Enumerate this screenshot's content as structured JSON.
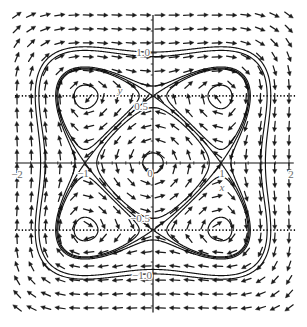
{
  "chart_data": {
    "type": "line",
    "subtype": "phase_portrait_with_direction_field",
    "title": "",
    "xlabel": "x",
    "ylabel": "y",
    "xlim": [
      -2.1,
      2.1
    ],
    "ylim": [
      -1.45,
      1.45
    ],
    "grid": false,
    "legend": null,
    "xticks": [
      -2,
      -1,
      0,
      1,
      2
    ],
    "xtick_labels": [
      "−2",
      "−1",
      "0",
      "1",
      "2"
    ],
    "yticks": [
      -1.0,
      -0.5,
      0.5,
      1.0
    ],
    "ytick_labels": [
      "−1.0",
      "−0.5",
      "0.5",
      "1.0"
    ],
    "x_minor_step": 0.2,
    "y_minor_step": 0.1,
    "axis_extent": {
      "x": [
        -2.03,
        2.07
      ],
      "y": [
        -1.36,
        1.345
      ]
    },
    "system": {
      "H": "(x^2-1)^2 + (y^2/a^2-1)^2",
      "a": 0.61,
      "dx_dt": "dH/dy",
      "dy_dt": "-dH/dx",
      "outer_rotation": "clockwise"
    },
    "direction_field": {
      "columns": 20,
      "rows": 22,
      "x_range": [
        -2.0,
        2.0
      ],
      "y_range": [
        -1.318,
        1.345
      ],
      "arrow_length_px": 10.5,
      "normalized": true
    },
    "equilibria": [
      {
        "x": 0,
        "y": 0,
        "type": "center"
      },
      {
        "x": -1,
        "y": 0.61,
        "type": "center"
      },
      {
        "x": 1,
        "y": 0.61,
        "type": "center"
      },
      {
        "x": -1,
        "y": -0.61,
        "type": "center"
      },
      {
        "x": 1,
        "y": -0.61,
        "type": "center"
      },
      {
        "x": -1,
        "y": 0,
        "type": "saddle"
      },
      {
        "x": 1,
        "y": 0,
        "type": "saddle"
      },
      {
        "x": 0,
        "y": 0.61,
        "type": "saddle"
      },
      {
        "x": 0,
        "y": -0.61,
        "type": "saddle"
      }
    ],
    "reference_lines": [
      {
        "orientation": "horizontal",
        "y": 0.61,
        "x_range": [
          -2.03,
          2.09
        ],
        "style": "dotted"
      },
      {
        "orientation": "horizontal",
        "y": -0.61,
        "x_range": [
          -2.03,
          2.09
        ],
        "style": "dotted"
      }
    ],
    "trajectories": [
      {
        "name": "small orbits around the four lobe centers",
        "H": 0.12
      },
      {
        "name": "small orbit around origin",
        "H": 1.955,
        "clip": [
          -0.35,
          0.35,
          -0.3,
          0.3
        ]
      },
      {
        "name": "orbits just inside separatrix lobes",
        "H": 0.92
      },
      {
        "name": "separatrix (heteroclinic cycle)",
        "H": 1.0
      },
      {
        "name": "orbits just outside separatrix",
        "H": 1.1
      },
      {
        "name": "outer closed orbit",
        "H": 3.3
      },
      {
        "name": "outer closed orbit",
        "H": 4.0
      }
    ]
  }
}
